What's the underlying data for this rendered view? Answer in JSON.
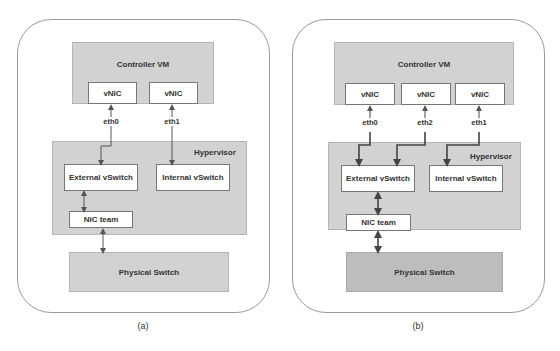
{
  "panel_a": {
    "controller_vm": "Controller VM",
    "vnics": [
      "vNIC",
      "vNIC"
    ],
    "eth_labels": [
      "eth0",
      "eth1"
    ],
    "hypervisor": "Hypervisor",
    "external_vswitch": "External vSwitch",
    "internal_vswitch": "Internal vSwitch",
    "nic_team": "NIC team",
    "physical_switch": "Physical Switch",
    "caption": "(a)"
  },
  "panel_b": {
    "controller_vm": "Controller VM",
    "vnics": [
      "vNIC",
      "vNIC",
      "vNIC"
    ],
    "eth_labels": [
      "eth0",
      "eth2",
      "eth1"
    ],
    "hypervisor": "Hypervisor",
    "external_vswitch": "External vSwitch",
    "internal_vswitch": "Internal vSwitch",
    "nic_team": "NIC team",
    "physical_switch": "Physical Switch",
    "caption": "(b)"
  },
  "colors": {
    "box_gray": "#d2d2d2",
    "physical_switch_b": "#bdbdbd",
    "line": "#555555"
  }
}
